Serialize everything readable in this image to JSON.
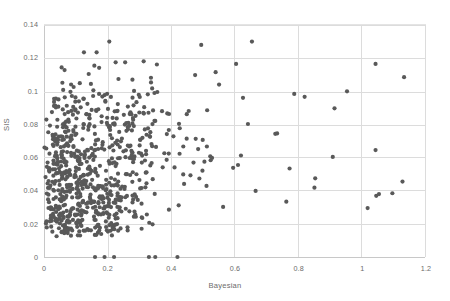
{
  "chart_data": {
    "type": "scatter",
    "title": "",
    "xlabel": "Bayesian",
    "ylabel": "SIS",
    "xlim": [
      0,
      1.2
    ],
    "ylim": [
      0,
      0.14
    ],
    "xticks": [
      "0",
      "0.2",
      "0.4",
      "0.6",
      "0.8",
      "1",
      "1.2"
    ],
    "xtick_values": [
      0,
      0.2,
      0.4,
      0.6,
      0.8,
      1,
      1.2
    ],
    "yticks": [
      "0",
      "0.02",
      "0.04",
      "0.06",
      "0.08",
      "0.1",
      "0.12",
      "0.14"
    ],
    "ytick_values": [
      0,
      0.02,
      0.04,
      0.06,
      0.08,
      0.1,
      0.12,
      0.14
    ],
    "grid": true,
    "legend": "none",
    "marker_color": "#595959",
    "marker_size_px": 4.2,
    "grid_color": "#dcdcdc",
    "n_points": 760,
    "notable_points": [
      {
        "x": 0.205,
        "y": 0.13
      },
      {
        "x": 0.655,
        "y": 0.13
      },
      {
        "x": 0.125,
        "y": 0.1235
      },
      {
        "x": 0.165,
        "y": 0.1235
      },
      {
        "x": 0.495,
        "y": 0.128
      },
      {
        "x": 0.255,
        "y": 0.1175
      },
      {
        "x": 0.225,
        "y": 0.1175
      },
      {
        "x": 0.605,
        "y": 0.1165
      },
      {
        "x": 1.045,
        "y": 0.1165
      },
      {
        "x": 1.135,
        "y": 0.1085
      },
      {
        "x": 1.045,
        "y": 0.0645
      },
      {
        "x": 1.02,
        "y": 0.0295
      },
      {
        "x": 1.13,
        "y": 0.0455
      },
      {
        "x": 0.955,
        "y": 0.1
      },
      {
        "x": 0.16,
        "y": 0.0
      },
      {
        "x": 0.19,
        "y": 0.0
      },
      {
        "x": 0.22,
        "y": 0.0
      },
      {
        "x": 0.33,
        "y": 0.0
      },
      {
        "x": 0.35,
        "y": 0.0
      },
      {
        "x": 0.42,
        "y": 0.0
      }
    ]
  }
}
